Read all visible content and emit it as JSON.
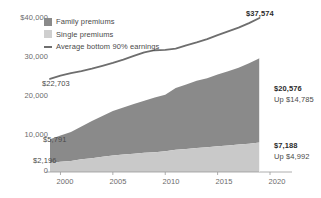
{
  "chart_data": {
    "type": "area",
    "title": "",
    "xlabel": "",
    "ylabel": "",
    "xlim": [
      1999,
      2020
    ],
    "ylim": [
      0,
      40000
    ],
    "grid": false,
    "legend_position": "top-left",
    "x": [
      1999,
      2000,
      2001,
      2002,
      2003,
      2004,
      2005,
      2006,
      2007,
      2008,
      2009,
      2010,
      2011,
      2012,
      2013,
      2014,
      2015,
      2016,
      2017,
      2018,
      2019
    ],
    "series": [
      {
        "name": "Single premiums",
        "color": "#c9c9c9",
        "stacked": true,
        "values": [
          2196,
          2471,
          2689,
          3083,
          3383,
          3695,
          4024,
          4242,
          4479,
          4704,
          4824,
          5049,
          5429,
          5615,
          5884,
          6025,
          6251,
          6435,
          6690,
          6896,
          7188
        ]
      },
      {
        "name": "Family premiums",
        "color": "#8a8a8a",
        "stacked": true,
        "values": [
          5791,
          6438,
          7061,
          8003,
          9068,
          9950,
          10880,
          11480,
          12106,
          12680,
          13375,
          13770,
          15073,
          15745,
          16351,
          16834,
          17545,
          18142,
          18764,
          19616,
          20576
        ]
      },
      {
        "name": "Average bottom 90% earnings",
        "color": "#6e6e6e",
        "type": "line",
        "values": [
          22703,
          23500,
          24100,
          24600,
          25200,
          25900,
          26600,
          27400,
          28300,
          29200,
          29700,
          29800,
          30100,
          30900,
          31600,
          32400,
          33400,
          34300,
          35200,
          36300,
          37574
        ]
      }
    ],
    "yticks": [
      0,
      10000,
      20000,
      30000,
      40000
    ],
    "ytick_labels": [
      "0",
      "10,000",
      "20,000",
      "30,000",
      "$40,000"
    ],
    "xticks": [
      2000,
      2005,
      2010,
      2015,
      2020
    ],
    "xtick_labels": [
      "2000",
      "2005",
      "2010",
      "2015",
      "2020"
    ],
    "annotations": [
      {
        "name": "earnings-start-label",
        "text": "$22,703",
        "x": 1999,
        "y": 22703
      },
      {
        "name": "earnings-end-label",
        "text": "$37,574",
        "x": 2019,
        "y": 37574
      },
      {
        "name": "family-start-label",
        "text": "$5,791",
        "x": 1999,
        "y": 5791
      },
      {
        "name": "family-end-label",
        "text": "$20,576",
        "x": 2019,
        "y": 20576
      },
      {
        "name": "family-end-delta",
        "text": "Up $14,785",
        "x": 2019,
        "y": 20576
      },
      {
        "name": "single-start-label",
        "text": "$2,196",
        "x": 1999,
        "y": 2196
      },
      {
        "name": "single-end-label",
        "text": "$7,188",
        "x": 2019,
        "y": 7188
      },
      {
        "name": "single-end-delta",
        "text": "Up $4,992",
        "x": 2019,
        "y": 7188
      }
    ]
  },
  "legend": {
    "items": [
      {
        "label": "Family premiums",
        "swatch": "family-swatch"
      },
      {
        "label": "Single premiums",
        "swatch": "single-swatch"
      },
      {
        "label": "Average bottom 90% earnings",
        "swatch": "earnings-line-swatch"
      }
    ]
  },
  "axes": {
    "y": {
      "t0": "0",
      "t1": "10,000",
      "t2": "20,000",
      "t3": "30,000",
      "t4": "$40,000"
    },
    "x": {
      "t0": "2000",
      "t1": "2005",
      "t2": "2010",
      "t3": "2015",
      "t4": "2020"
    }
  },
  "callouts": {
    "earnings_start": "$22,703",
    "earnings_end": "$37,574",
    "family_start": "$5,791",
    "family_end": "$20,576",
    "family_delta": "Up $14,785",
    "single_start": "$2,196",
    "single_end": "$7,188",
    "single_delta": "Up $4,992"
  },
  "colors": {
    "family": "#8a8a8a",
    "single": "#c9c9c9",
    "earnings_line": "#6e6e6e",
    "axis": "#9a9a9a",
    "text": "#4a4a4a",
    "text_bold": "#2b2b2b"
  }
}
